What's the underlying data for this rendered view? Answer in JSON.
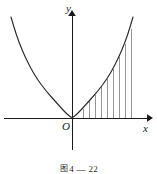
{
  "figure": {
    "caption_marker": "图",
    "caption_text": "4 — 22",
    "axes": {
      "x_label": "x",
      "y_label": "y",
      "origin_label": "O"
    },
    "colors": {
      "axis": "#1a1a1a",
      "curve": "#2b2b2b",
      "ordinate": "#8a8a8a",
      "background": "#ffffff"
    }
  },
  "chart_data": {
    "type": "line",
    "title": "",
    "xlabel": "x",
    "ylabel": "y",
    "grid": false,
    "legend": false,
    "function": "y = a*x^2",
    "vertex": [
      0,
      0
    ],
    "axis_ranges": {
      "x_pixel_axis_y": 118,
      "y_pixel_axis_x": 72,
      "x_visible": [
        -72,
        76
      ],
      "y_visible": [
        0,
        108
      ]
    },
    "curve_points_px": [
      [
        11,
        17
      ],
      [
        16,
        34
      ],
      [
        22,
        50
      ],
      [
        29,
        65
      ],
      [
        37,
        79
      ],
      [
        46,
        91
      ],
      [
        55,
        101
      ],
      [
        63,
        110
      ],
      [
        68,
        115
      ],
      [
        72,
        118
      ],
      [
        76,
        115
      ],
      [
        81,
        110
      ],
      [
        89,
        101
      ],
      [
        98,
        91
      ],
      [
        107,
        79
      ],
      [
        115,
        65
      ],
      [
        122,
        50
      ],
      [
        128,
        34
      ],
      [
        133,
        17
      ]
    ],
    "ordinates_px": [
      {
        "x": 83,
        "y_top": 109,
        "y_bottom": 118
      },
      {
        "x": 89,
        "y_top": 101,
        "y_bottom": 118
      },
      {
        "x": 95,
        "y_top": 95,
        "y_bottom": 118
      },
      {
        "x": 101,
        "y_top": 87,
        "y_bottom": 118
      },
      {
        "x": 107,
        "y_top": 79,
        "y_bottom": 118
      },
      {
        "x": 113,
        "y_top": 69,
        "y_bottom": 118
      },
      {
        "x": 119,
        "y_top": 57,
        "y_bottom": 118
      },
      {
        "x": 125,
        "y_top": 44,
        "y_bottom": 118
      },
      {
        "x": 131,
        "y_top": 29,
        "y_bottom": 118
      }
    ],
    "ordinate_count": 9
  }
}
